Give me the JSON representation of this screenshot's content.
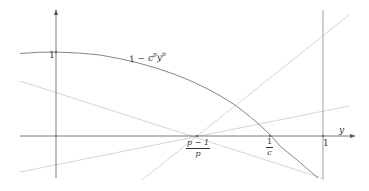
{
  "diagram": {
    "type": "function-plot",
    "axes": {
      "x_label": "y",
      "y_tick_label": "1"
    },
    "curve": {
      "label_prefix": "1 − ",
      "label_c": "c",
      "label_c_exp": "p",
      "label_y": "y",
      "label_y_exp": "p"
    },
    "x_ticks": {
      "p_minus_1_over_p": {
        "numerator": "p − 1",
        "denominator": "p"
      },
      "one_over_c": {
        "numerator": "1",
        "denominator": "c"
      },
      "one": "1"
    },
    "colors": {
      "axis": "#555555",
      "curve": "#777777",
      "lines": "#cccccc",
      "text": "#333333"
    }
  }
}
